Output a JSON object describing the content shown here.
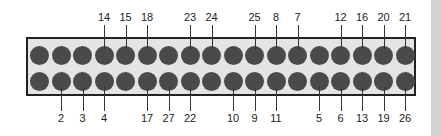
{
  "diagram": {
    "type": "connector-pinout",
    "pins_per_row": 18,
    "colors": {
      "box_fill": "#e4e4e4",
      "pin": "#4a4a4a",
      "outline": "#222222"
    },
    "top_row_labels": [
      {
        "index": 3,
        "label": "14"
      },
      {
        "index": 4,
        "label": "15"
      },
      {
        "index": 5,
        "label": "18"
      },
      {
        "index": 7,
        "label": "23"
      },
      {
        "index": 8,
        "label": "24"
      },
      {
        "index": 10,
        "label": "25"
      },
      {
        "index": 11,
        "label": "8"
      },
      {
        "index": 12,
        "label": "7"
      },
      {
        "index": 14,
        "label": "12"
      },
      {
        "index": 15,
        "label": "16"
      },
      {
        "index": 16,
        "label": "20"
      },
      {
        "index": 17,
        "label": "21"
      }
    ],
    "bottom_row_labels": [
      {
        "index": 1,
        "label": "2"
      },
      {
        "index": 2,
        "label": "3"
      },
      {
        "index": 3,
        "label": "4"
      },
      {
        "index": 5,
        "label": "17"
      },
      {
        "index": 6,
        "label": "27"
      },
      {
        "index": 7,
        "label": "22"
      },
      {
        "index": 9,
        "label": "10"
      },
      {
        "index": 10,
        "label": "9"
      },
      {
        "index": 11,
        "label": "11"
      },
      {
        "index": 13,
        "label": "5"
      },
      {
        "index": 14,
        "label": "6"
      },
      {
        "index": 15,
        "label": "13"
      },
      {
        "index": 16,
        "label": "19"
      },
      {
        "index": 17,
        "label": "26"
      }
    ]
  }
}
